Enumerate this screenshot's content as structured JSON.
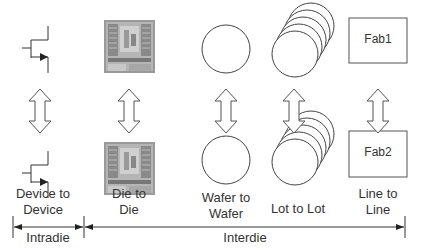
{
  "columns": [
    {
      "id": "device",
      "label_line1": "Device to",
      "label_line2": "Device",
      "top_icon": "transistor-icon",
      "bottom_icon": "transistor-icon"
    },
    {
      "id": "die",
      "label_line1": "Die to",
      "label_line2": "Die",
      "top_icon": "die-image",
      "bottom_icon": "die-image"
    },
    {
      "id": "wafer",
      "label_line1": "Wafer to",
      "label_line2": "Wafer",
      "top_icon": "wafer-circle-icon",
      "bottom_icon": "wafer-circle-icon"
    },
    {
      "id": "lot",
      "label": "Lot to Lot",
      "top_icon": "wafer-stack-icon",
      "bottom_icon": "wafer-stack-icon"
    },
    {
      "id": "line",
      "label_line1": "Line to",
      "label_line2": "Line",
      "top_box": "Fab1",
      "bottom_box": "Fab2"
    }
  ],
  "ranges": {
    "intradie": "Intradie",
    "interdie": "Interdie"
  },
  "colors": {
    "stroke": "#333333",
    "die_fill": "#9a9a9a"
  }
}
